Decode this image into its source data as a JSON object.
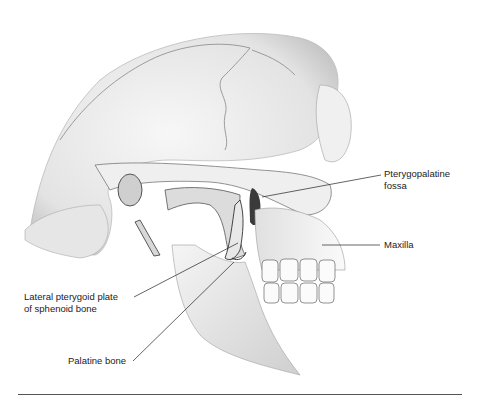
{
  "figure": {
    "labels": [
      {
        "id": "pterygopalatine-fossa",
        "lines": [
          "Pterygopalatine",
          "fossa"
        ]
      },
      {
        "id": "maxilla",
        "lines": [
          "Maxilla"
        ]
      },
      {
        "id": "lateral-pterygoid-plate",
        "lines": [
          "Lateral pterygoid plate",
          "of sphenoid bone"
        ]
      },
      {
        "id": "palatine-bone",
        "lines": [
          "Palatine bone"
        ]
      }
    ]
  },
  "colors": {
    "background": "#ffffff",
    "bone_light": "#f2f2f2",
    "bone_shadow": "#9a9a9a",
    "outline": "#3a3a3a",
    "label_text": "#222222",
    "rule": "#555555"
  }
}
